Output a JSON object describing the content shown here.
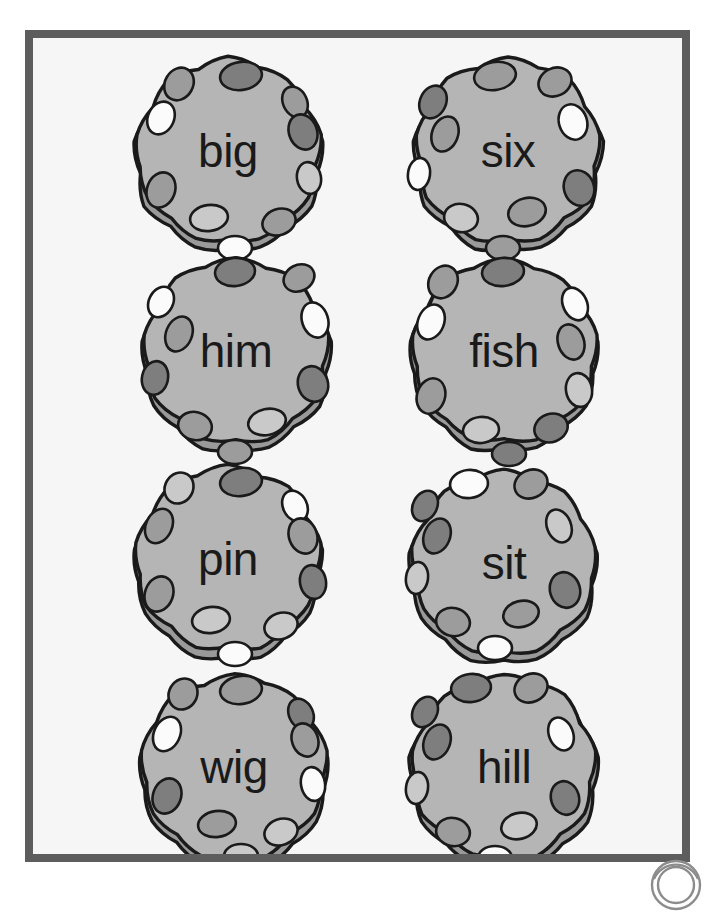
{
  "page": {
    "background_color": "#ffffff",
    "frame": {
      "border_color": "#5d5d5d",
      "fill_color": "#f6f6f6",
      "border_width_px": 8
    }
  },
  "palette": {
    "ball_body": "#b5b5b5",
    "ball_rim": "#9a9a9a",
    "outline": "#1a1a1a",
    "spot_dark": "#7e7e7e",
    "spot_mid": "#9c9c9c",
    "spot_light": "#c9c9c9",
    "spot_white": "#fbfbfb",
    "text": "#1a1a1a"
  },
  "grid": {
    "columns": 2,
    "rows": 4,
    "cell_width_px": 210,
    "cell_height_px": 210
  },
  "balls": [
    {
      "id": "ball-big",
      "word": "big",
      "row": 1,
      "column": 1,
      "x": 90,
      "y": 12,
      "spots": [
        {
          "cx": 118,
          "cy": 26,
          "rx": 21,
          "ry": 14,
          "rot": -8,
          "tone": "spot_dark"
        },
        {
          "cx": 56,
          "cy": 34,
          "rx": 14,
          "ry": 17,
          "rot": 30,
          "tone": "spot_mid"
        },
        {
          "cx": 38,
          "cy": 68,
          "rx": 13,
          "ry": 17,
          "rot": 25,
          "tone": "spot_white"
        },
        {
          "cx": 172,
          "cy": 52,
          "rx": 12,
          "ry": 16,
          "rot": -25,
          "tone": "spot_mid"
        },
        {
          "cx": 180,
          "cy": 82,
          "rx": 14,
          "ry": 18,
          "rot": -20,
          "tone": "spot_dark"
        },
        {
          "cx": 186,
          "cy": 128,
          "rx": 12,
          "ry": 16,
          "rot": -10,
          "tone": "spot_light"
        },
        {
          "cx": 38,
          "cy": 140,
          "rx": 14,
          "ry": 18,
          "rot": 20,
          "tone": "spot_mid"
        },
        {
          "cx": 86,
          "cy": 168,
          "rx": 19,
          "ry": 13,
          "rot": -8,
          "tone": "spot_light"
        },
        {
          "cx": 156,
          "cy": 172,
          "rx": 17,
          "ry": 13,
          "rot": -20,
          "tone": "spot_mid"
        },
        {
          "cx": 112,
          "cy": 198,
          "rx": 17,
          "ry": 12,
          "rot": 0,
          "tone": "spot_white"
        }
      ]
    },
    {
      "id": "ball-six",
      "word": "six",
      "row": 1,
      "column": 2,
      "x": 370,
      "y": 12,
      "spots": [
        {
          "cx": 92,
          "cy": 26,
          "rx": 21,
          "ry": 14,
          "rot": -10,
          "tone": "spot_mid"
        },
        {
          "cx": 152,
          "cy": 32,
          "rx": 17,
          "ry": 14,
          "rot": -25,
          "tone": "spot_mid"
        },
        {
          "cx": 30,
          "cy": 52,
          "rx": 13,
          "ry": 17,
          "rot": 25,
          "tone": "spot_dark"
        },
        {
          "cx": 42,
          "cy": 84,
          "rx": 13,
          "ry": 18,
          "rot": 20,
          "tone": "spot_mid"
        },
        {
          "cx": 170,
          "cy": 72,
          "rx": 14,
          "ry": 18,
          "rot": -18,
          "tone": "spot_white"
        },
        {
          "cx": 16,
          "cy": 124,
          "rx": 11,
          "ry": 16,
          "rot": 8,
          "tone": "spot_white"
        },
        {
          "cx": 176,
          "cy": 138,
          "rx": 15,
          "ry": 18,
          "rot": -18,
          "tone": "spot_dark"
        },
        {
          "cx": 58,
          "cy": 168,
          "rx": 17,
          "ry": 14,
          "rot": 12,
          "tone": "spot_light"
        },
        {
          "cx": 124,
          "cy": 162,
          "rx": 19,
          "ry": 14,
          "rot": -14,
          "tone": "spot_mid"
        },
        {
          "cx": 100,
          "cy": 198,
          "rx": 17,
          "ry": 12,
          "rot": 0,
          "tone": "spot_mid"
        }
      ]
    },
    {
      "id": "ball-him",
      "word": "him",
      "row": 2,
      "column": 1,
      "x": 98,
      "y": 212,
      "spots": [
        {
          "cx": 104,
          "cy": 22,
          "rx": 20,
          "ry": 14,
          "rot": -6,
          "tone": "spot_dark"
        },
        {
          "cx": 168,
          "cy": 28,
          "rx": 16,
          "ry": 13,
          "rot": -28,
          "tone": "spot_mid"
        },
        {
          "cx": 30,
          "cy": 52,
          "rx": 12,
          "ry": 16,
          "rot": 28,
          "tone": "spot_white"
        },
        {
          "cx": 48,
          "cy": 84,
          "rx": 13,
          "ry": 18,
          "rot": 22,
          "tone": "spot_mid"
        },
        {
          "cx": 184,
          "cy": 70,
          "rx": 13,
          "ry": 18,
          "rot": -18,
          "tone": "spot_white"
        },
        {
          "cx": 24,
          "cy": 128,
          "rx": 13,
          "ry": 17,
          "rot": 12,
          "tone": "spot_dark"
        },
        {
          "cx": 182,
          "cy": 134,
          "rx": 15,
          "ry": 18,
          "rot": -16,
          "tone": "spot_dark"
        },
        {
          "cx": 64,
          "cy": 176,
          "rx": 17,
          "ry": 14,
          "rot": 14,
          "tone": "spot_mid"
        },
        {
          "cx": 136,
          "cy": 172,
          "rx": 19,
          "ry": 13,
          "rot": -12,
          "tone": "spot_light"
        },
        {
          "cx": 104,
          "cy": 202,
          "rx": 17,
          "ry": 12,
          "rot": 0,
          "tone": "spot_mid"
        }
      ]
    },
    {
      "id": "ball-fish",
      "word": "fish",
      "row": 2,
      "column": 2,
      "x": 366,
      "y": 212,
      "spots": [
        {
          "cx": 104,
          "cy": 22,
          "rx": 21,
          "ry": 14,
          "rot": -6,
          "tone": "spot_dark"
        },
        {
          "cx": 44,
          "cy": 32,
          "rx": 14,
          "ry": 17,
          "rot": 30,
          "tone": "spot_mid"
        },
        {
          "cx": 32,
          "cy": 72,
          "rx": 13,
          "ry": 18,
          "rot": 22,
          "tone": "spot_white"
        },
        {
          "cx": 176,
          "cy": 54,
          "rx": 12,
          "ry": 17,
          "rot": -24,
          "tone": "spot_white"
        },
        {
          "cx": 172,
          "cy": 92,
          "rx": 13,
          "ry": 18,
          "rot": -18,
          "tone": "spot_mid"
        },
        {
          "cx": 180,
          "cy": 140,
          "rx": 13,
          "ry": 17,
          "rot": -10,
          "tone": "spot_light"
        },
        {
          "cx": 32,
          "cy": 146,
          "rx": 14,
          "ry": 18,
          "rot": 18,
          "tone": "spot_mid"
        },
        {
          "cx": 82,
          "cy": 180,
          "rx": 18,
          "ry": 13,
          "rot": -6,
          "tone": "spot_light"
        },
        {
          "cx": 152,
          "cy": 178,
          "rx": 17,
          "ry": 14,
          "rot": -20,
          "tone": "spot_dark"
        },
        {
          "cx": 110,
          "cy": 204,
          "rx": 17,
          "ry": 12,
          "rot": 0,
          "tone": "spot_dark"
        }
      ]
    },
    {
      "id": "ball-pin",
      "word": "pin",
      "row": 3,
      "column": 1,
      "x": 90,
      "y": 420,
      "spots": [
        {
          "cx": 118,
          "cy": 24,
          "rx": 21,
          "ry": 14,
          "rot": -8,
          "tone": "spot_dark"
        },
        {
          "cx": 56,
          "cy": 30,
          "rx": 14,
          "ry": 16,
          "rot": 30,
          "tone": "spot_light"
        },
        {
          "cx": 36,
          "cy": 68,
          "rx": 13,
          "ry": 18,
          "rot": 25,
          "tone": "spot_mid"
        },
        {
          "cx": 172,
          "cy": 48,
          "rx": 12,
          "ry": 16,
          "rot": -26,
          "tone": "spot_white"
        },
        {
          "cx": 180,
          "cy": 78,
          "rx": 14,
          "ry": 18,
          "rot": -20,
          "tone": "spot_mid"
        },
        {
          "cx": 190,
          "cy": 124,
          "rx": 13,
          "ry": 17,
          "rot": -10,
          "tone": "spot_dark"
        },
        {
          "cx": 36,
          "cy": 136,
          "rx": 14,
          "ry": 18,
          "rot": 20,
          "tone": "spot_mid"
        },
        {
          "cx": 88,
          "cy": 162,
          "rx": 19,
          "ry": 13,
          "rot": -8,
          "tone": "spot_light"
        },
        {
          "cx": 158,
          "cy": 168,
          "rx": 17,
          "ry": 13,
          "rot": -20,
          "tone": "spot_light"
        },
        {
          "cx": 112,
          "cy": 196,
          "rx": 17,
          "ry": 12,
          "rot": 0,
          "tone": "spot_white"
        }
      ]
    },
    {
      "id": "ball-sit",
      "word": "sit",
      "row": 3,
      "column": 2,
      "x": 366,
      "y": 424,
      "spots": [
        {
          "cx": 70,
          "cy": 22,
          "rx": 19,
          "ry": 14,
          "rot": -6,
          "tone": "spot_white"
        },
        {
          "cx": 132,
          "cy": 22,
          "rx": 17,
          "ry": 14,
          "rot": -24,
          "tone": "spot_mid"
        },
        {
          "cx": 26,
          "cy": 44,
          "rx": 12,
          "ry": 16,
          "rot": 28,
          "tone": "spot_dark"
        },
        {
          "cx": 38,
          "cy": 74,
          "rx": 13,
          "ry": 18,
          "rot": 22,
          "tone": "spot_dark"
        },
        {
          "cx": 160,
          "cy": 64,
          "rx": 12,
          "ry": 17,
          "rot": -22,
          "tone": "spot_light"
        },
        {
          "cx": 18,
          "cy": 116,
          "rx": 11,
          "ry": 16,
          "rot": 8,
          "tone": "spot_light"
        },
        {
          "cx": 166,
          "cy": 128,
          "rx": 15,
          "ry": 18,
          "rot": -16,
          "tone": "spot_dark"
        },
        {
          "cx": 54,
          "cy": 160,
          "rx": 17,
          "ry": 14,
          "rot": 12,
          "tone": "spot_mid"
        },
        {
          "cx": 122,
          "cy": 152,
          "rx": 18,
          "ry": 13,
          "rot": -14,
          "tone": "spot_mid"
        },
        {
          "cx": 96,
          "cy": 186,
          "rx": 17,
          "ry": 12,
          "rot": 0,
          "tone": "spot_white"
        }
      ]
    },
    {
      "id": "ball-wig",
      "word": "wig",
      "row": 4,
      "column": 1,
      "x": 96,
      "y": 628,
      "spots": [
        {
          "cx": 112,
          "cy": 24,
          "rx": 21,
          "ry": 14,
          "rot": -8,
          "tone": "spot_mid"
        },
        {
          "cx": 54,
          "cy": 28,
          "rx": 14,
          "ry": 16,
          "rot": 30,
          "tone": "spot_mid"
        },
        {
          "cx": 38,
          "cy": 68,
          "rx": 13,
          "ry": 18,
          "rot": 25,
          "tone": "spot_white"
        },
        {
          "cx": 172,
          "cy": 48,
          "rx": 12,
          "ry": 16,
          "rot": -26,
          "tone": "spot_dark"
        },
        {
          "cx": 176,
          "cy": 74,
          "rx": 13,
          "ry": 17,
          "rot": -20,
          "tone": "spot_mid"
        },
        {
          "cx": 184,
          "cy": 118,
          "rx": 12,
          "ry": 17,
          "rot": -10,
          "tone": "spot_white"
        },
        {
          "cx": 38,
          "cy": 130,
          "rx": 14,
          "ry": 18,
          "rot": 20,
          "tone": "spot_dark"
        },
        {
          "cx": 88,
          "cy": 158,
          "rx": 19,
          "ry": 13,
          "rot": -8,
          "tone": "spot_mid"
        },
        {
          "cx": 152,
          "cy": 166,
          "rx": 17,
          "ry": 13,
          "rot": -20,
          "tone": "spot_light"
        },
        {
          "cx": 112,
          "cy": 190,
          "rx": 17,
          "ry": 12,
          "rot": 0,
          "tone": "spot_light"
        }
      ]
    },
    {
      "id": "ball-hill",
      "word": "hill",
      "row": 4,
      "column": 2,
      "x": 366,
      "y": 628,
      "spots": [
        {
          "cx": 72,
          "cy": 22,
          "rx": 20,
          "ry": 14,
          "rot": -6,
          "tone": "spot_dark"
        },
        {
          "cx": 132,
          "cy": 22,
          "rx": 17,
          "ry": 14,
          "rot": -24,
          "tone": "spot_mid"
        },
        {
          "cx": 26,
          "cy": 46,
          "rx": 12,
          "ry": 16,
          "rot": 28,
          "tone": "spot_dark"
        },
        {
          "cx": 38,
          "cy": 76,
          "rx": 13,
          "ry": 18,
          "rot": 22,
          "tone": "spot_dark"
        },
        {
          "cx": 162,
          "cy": 68,
          "rx": 12,
          "ry": 17,
          "rot": -22,
          "tone": "spot_white"
        },
        {
          "cx": 18,
          "cy": 122,
          "rx": 11,
          "ry": 16,
          "rot": 8,
          "tone": "spot_light"
        },
        {
          "cx": 166,
          "cy": 132,
          "rx": 14,
          "ry": 17,
          "rot": -16,
          "tone": "spot_dark"
        },
        {
          "cx": 54,
          "cy": 166,
          "rx": 17,
          "ry": 14,
          "rot": 12,
          "tone": "spot_mid"
        },
        {
          "cx": 120,
          "cy": 160,
          "rx": 18,
          "ry": 13,
          "rot": -14,
          "tone": "spot_light"
        },
        {
          "cx": 96,
          "cy": 192,
          "rx": 17,
          "ry": 12,
          "rot": 0,
          "tone": "spot_white"
        }
      ]
    }
  ],
  "corner_logo": {
    "name": "rounded-watermark-logo",
    "color": "#8c8c8c"
  }
}
